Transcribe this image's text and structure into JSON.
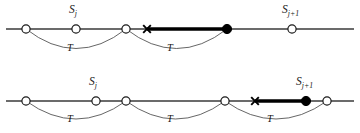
{
  "figure": {
    "caption_labels": {
      "s_j": {
        "base": "S",
        "sub": "j"
      },
      "s_j_plus_1": {
        "base": "S",
        "sub": "j+1"
      },
      "t": "T"
    },
    "colors": {
      "line": "#3a3a3a",
      "thick_line": "#000000",
      "arc": "#4a4a4a",
      "node_fill": "#ffffff",
      "node_stroke": "#1a1a1a",
      "filled_node": "#000000",
      "cross": "#000000",
      "background": "#ffffff"
    },
    "rows": [
      {
        "name": "row-top",
        "baseline_y": 29,
        "line_start_x": 6,
        "line_end_x": 354,
        "open_nodes_x": [
          26,
          76,
          126,
          292
        ],
        "cross_x": 147,
        "filled_node_x": 227,
        "thick_segment": {
          "x1": 147,
          "x2": 227
        },
        "arcs": [
          {
            "x1": 26,
            "x2": 126,
            "depth": 26,
            "label": "T",
            "label_x": 72,
            "label_y": 48
          },
          {
            "x1": 126,
            "x2": 227,
            "depth": 26,
            "label": "T",
            "label_x": 172,
            "label_y": 48
          }
        ],
        "s_labels": [
          {
            "text_key": "s_j",
            "x": 69,
            "y": 5
          },
          {
            "text_key": "s_j_plus_1",
            "x": 282,
            "y": 5
          }
        ]
      },
      {
        "name": "row-bottom",
        "baseline_y": 101,
        "line_start_x": 6,
        "line_end_x": 354,
        "open_nodes_x": [
          26,
          96,
          126,
          225,
          327
        ],
        "cross_x": 255,
        "filled_node_x": 306,
        "thick_segment": {
          "x1": 255,
          "x2": 306
        },
        "arcs": [
          {
            "x1": 26,
            "x2": 126,
            "depth": 24,
            "label": "T",
            "label_x": 72,
            "label_y": 119
          },
          {
            "x1": 126,
            "x2": 225,
            "depth": 24,
            "label": "T",
            "label_x": 172,
            "label_y": 119
          },
          {
            "x1": 225,
            "x2": 327,
            "depth": 24,
            "label": "T",
            "label_x": 272,
            "label_y": 119
          }
        ],
        "s_labels": [
          {
            "text_key": "s_j",
            "x": 89,
            "y": 77
          },
          {
            "text_key": "s_j_plus_1",
            "x": 296,
            "y": 77
          }
        ]
      }
    ]
  }
}
